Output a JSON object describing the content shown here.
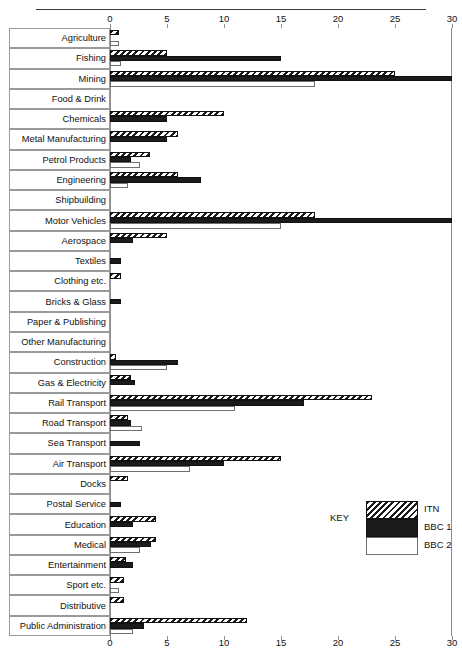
{
  "legend": {
    "key_label": "KEY",
    "entries": [
      {
        "name": "ITN",
        "pattern": "diagonal-hatch"
      },
      {
        "name": "BBC 1",
        "pattern": "solid-black"
      },
      {
        "name": "BBC 2",
        "pattern": "white-outline"
      }
    ]
  },
  "chart_data": {
    "type": "bar",
    "orientation": "horizontal",
    "title": "",
    "xlabel": "",
    "ylabel": "",
    "xlim": [
      0,
      30
    ],
    "xticks": [
      0,
      5,
      10,
      15,
      20,
      25,
      30
    ],
    "xtick_labels": [
      "0",
      "5",
      "10",
      "15",
      "20",
      "25",
      "30"
    ],
    "grid": false,
    "axis_positions": [
      "top",
      "bottom"
    ],
    "legend_position": "bottom-right",
    "categories": [
      "Agriculture",
      "Fishing",
      "Mining",
      "Food & Drink",
      "Chemicals",
      "Metal Manufacturing",
      "Petrol Products",
      "Engineering",
      "Shipbuilding",
      "Motor Vehicles",
      "Aerospace",
      "Textiles",
      "Clothing etc.",
      "Bricks & Glass",
      "Paper & Publishing",
      "Other Manufacturing",
      "Construction",
      "Gas & Electricity",
      "Rail Transport",
      "Road Transport",
      "Sea Transport",
      "Air Transport",
      "Docks",
      "Postal Service",
      "Education",
      "Medical",
      "Entertainment",
      "Sport etc.",
      "Distributive",
      "Public Administration"
    ],
    "series": [
      {
        "name": "ITN",
        "values": [
          0.8,
          5.0,
          25.0,
          0,
          10.0,
          6.0,
          3.5,
          6.0,
          0,
          18.0,
          5.0,
          0,
          1.0,
          0,
          0,
          0,
          0.5,
          1.8,
          23.0,
          1.6,
          0,
          15.0,
          1.6,
          0,
          4.0,
          4.0,
          1.4,
          1.2,
          1.2,
          12.0
        ]
      },
      {
        "name": "BBC 1",
        "values": [
          0,
          15.0,
          30.0,
          0,
          5.0,
          5.0,
          1.8,
          8.0,
          0,
          30.0,
          2.0,
          1.0,
          0,
          1.0,
          0,
          0,
          6.0,
          2.2,
          17.0,
          1.8,
          2.6,
          10.0,
          0,
          1.0,
          2.0,
          3.6,
          2.0,
          0,
          0,
          3.0
        ]
      },
      {
        "name": "BBC 2",
        "values": [
          0.8,
          1.0,
          18.0,
          0,
          0,
          0,
          2.6,
          1.6,
          0,
          15.0,
          0,
          0,
          0,
          0,
          0,
          0,
          5.0,
          0,
          11.0,
          2.8,
          0,
          7.0,
          0,
          0,
          0,
          2.6,
          0,
          0.8,
          0,
          2.0
        ]
      }
    ]
  }
}
